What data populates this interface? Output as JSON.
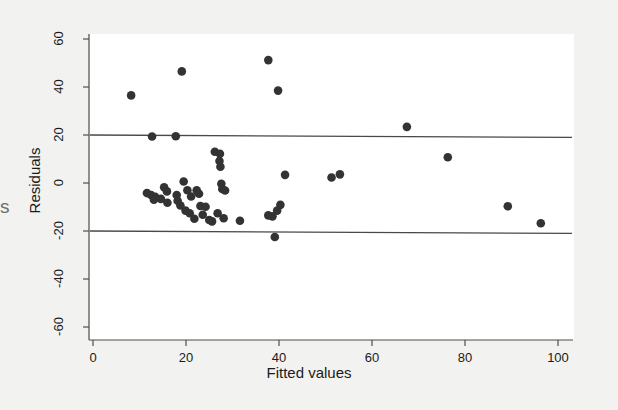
{
  "figure": {
    "background_color": "#f2f2f0",
    "plot_background_color": "#ffffff",
    "point_color": "#333333",
    "axis_color": "#4d4d4d",
    "reference_line_color": "#3a3a3a",
    "edge_fragment_text": "s"
  },
  "chart_data": {
    "type": "scatter",
    "title": "",
    "xlabel": "Fitted values",
    "ylabel": "Residuals",
    "xlim": [
      -2,
      102
    ],
    "ylim": [
      -66,
      64
    ],
    "xticks": [
      0,
      20,
      40,
      60,
      80,
      100
    ],
    "xtick_labels": [
      "0",
      "20",
      "40",
      "60",
      "80",
      "100"
    ],
    "yticks": [
      -60,
      -40,
      -20,
      0,
      20,
      40,
      60
    ],
    "ytick_labels": [
      "-60",
      "-40",
      "-20",
      "0",
      "20",
      "40",
      "60"
    ],
    "grid": false,
    "legend": null,
    "reference_lines": [
      {
        "name": "upper-limit",
        "type": "horizontal-near-flat",
        "y_left": 20.0,
        "y_right": 19.0
      },
      {
        "name": "lower-limit",
        "type": "horizontal-near-flat",
        "y_left": -20.0,
        "y_right": -21.0
      }
    ],
    "points": [
      {
        "x": 8.2,
        "y": 36.5
      },
      {
        "x": 19.1,
        "y": 46.5
      },
      {
        "x": 37.7,
        "y": 51.2
      },
      {
        "x": 39.8,
        "y": 38.5
      },
      {
        "x": 67.5,
        "y": 23.4
      },
      {
        "x": 12.7,
        "y": 19.4
      },
      {
        "x": 17.8,
        "y": 19.5
      },
      {
        "x": 26.2,
        "y": 13.0
      },
      {
        "x": 27.3,
        "y": 12.2
      },
      {
        "x": 27.2,
        "y": 9.2
      },
      {
        "x": 27.4,
        "y": 6.8
      },
      {
        "x": 76.3,
        "y": 10.7
      },
      {
        "x": 41.3,
        "y": 3.4
      },
      {
        "x": 51.3,
        "y": 2.3
      },
      {
        "x": 53.1,
        "y": 3.6
      },
      {
        "x": 19.5,
        "y": 0.6
      },
      {
        "x": 27.6,
        "y": -0.3
      },
      {
        "x": 27.8,
        "y": -2.5
      },
      {
        "x": 28.4,
        "y": -3.1
      },
      {
        "x": 15.3,
        "y": -1.8
      },
      {
        "x": 15.9,
        "y": -3.5
      },
      {
        "x": 11.6,
        "y": -4.2
      },
      {
        "x": 12.5,
        "y": -5.0
      },
      {
        "x": 13.4,
        "y": -5.8
      },
      {
        "x": 13.1,
        "y": -7.0
      },
      {
        "x": 14.6,
        "y": -6.6
      },
      {
        "x": 16.0,
        "y": -8.2
      },
      {
        "x": 18.0,
        "y": -5.0
      },
      {
        "x": 18.2,
        "y": -7.4
      },
      {
        "x": 18.8,
        "y": -9.4
      },
      {
        "x": 20.3,
        "y": -3.0
      },
      {
        "x": 21.1,
        "y": -5.6
      },
      {
        "x": 22.3,
        "y": -3.0
      },
      {
        "x": 22.8,
        "y": -4.5
      },
      {
        "x": 23.1,
        "y": -9.6
      },
      {
        "x": 24.2,
        "y": -9.9
      },
      {
        "x": 19.9,
        "y": -11.5
      },
      {
        "x": 20.8,
        "y": -12.6
      },
      {
        "x": 21.8,
        "y": -14.9
      },
      {
        "x": 23.6,
        "y": -13.2
      },
      {
        "x": 25.0,
        "y": -15.4
      },
      {
        "x": 25.6,
        "y": -16.0
      },
      {
        "x": 26.8,
        "y": -12.6
      },
      {
        "x": 28.1,
        "y": -14.7
      },
      {
        "x": 31.6,
        "y": -15.7
      },
      {
        "x": 37.7,
        "y": -13.5
      },
      {
        "x": 38.6,
        "y": -13.9
      },
      {
        "x": 40.3,
        "y": -9.1
      },
      {
        "x": 39.6,
        "y": -11.5
      },
      {
        "x": 39.1,
        "y": -22.5
      },
      {
        "x": 89.2,
        "y": -9.7
      },
      {
        "x": 96.3,
        "y": -16.8
      }
    ]
  }
}
